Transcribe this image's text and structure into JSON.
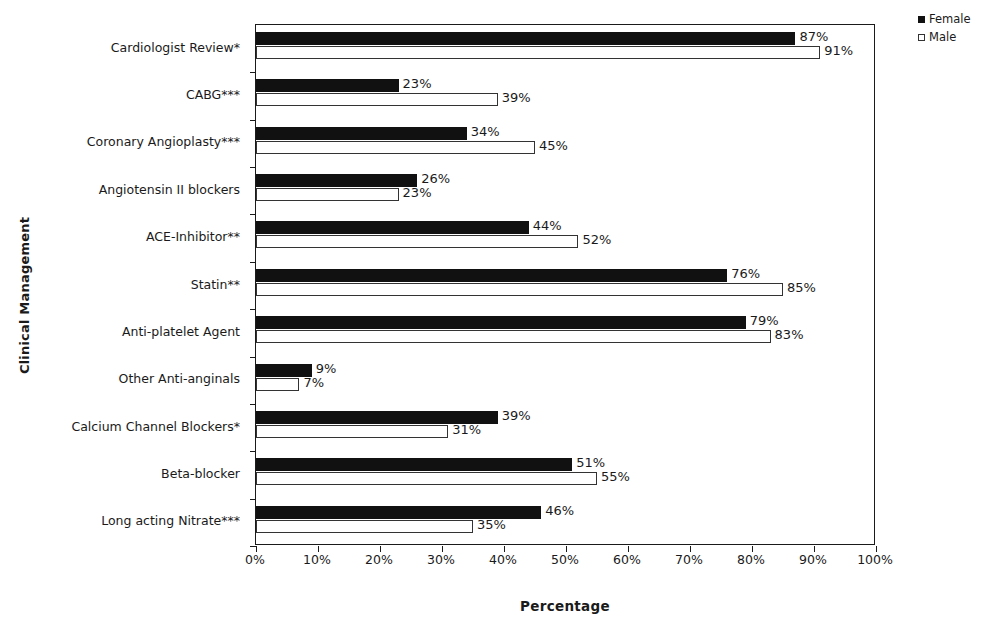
{
  "chart_data": {
    "type": "bar",
    "orientation": "horizontal",
    "title": "",
    "xlabel": "Percentage",
    "ylabel": "Clinical Management",
    "xlim": [
      0,
      100
    ],
    "xticks": [
      "0%",
      "10%",
      "20%",
      "30%",
      "40%",
      "50%",
      "60%",
      "70%",
      "80%",
      "90%",
      "100%"
    ],
    "xtick_values": [
      0,
      10,
      20,
      30,
      40,
      50,
      60,
      70,
      80,
      90,
      100
    ],
    "grid": false,
    "legend_position": "top-right",
    "value_label_suffix": "%",
    "categories": [
      "Cardiologist Review*",
      "CABG***",
      "Coronary Angioplasty***",
      "Angiotensin II blockers",
      "ACE-Inhibitor**",
      "Statin**",
      "Anti-platelet Agent",
      "Other Anti-anginals",
      "Calcium Channel Blockers*",
      "Beta-blocker",
      "Long acting Nitrate***"
    ],
    "series": [
      {
        "name": "Female",
        "color": "#111111",
        "fill": "solid",
        "values": [
          87,
          23,
          34,
          26,
          44,
          76,
          79,
          9,
          39,
          51,
          46
        ],
        "labels": [
          "87%",
          "23%",
          "34%",
          "26%",
          "44%",
          "76%",
          "79%",
          "9%",
          "39%",
          "51%",
          "46%"
        ]
      },
      {
        "name": "Male",
        "color": "#ffffff",
        "fill": "outline",
        "values": [
          91,
          39,
          45,
          23,
          52,
          85,
          83,
          7,
          31,
          55,
          35
        ],
        "labels": [
          "91%",
          "39%",
          "45%",
          "23%",
          "52%",
          "85%",
          "83%",
          "7%",
          "31%",
          "55%",
          "35%"
        ]
      }
    ]
  },
  "legend": {
    "items": [
      {
        "label": "Female",
        "swatch": "filled-square-icon"
      },
      {
        "label": "Male",
        "swatch": "outline-square-icon"
      }
    ]
  }
}
